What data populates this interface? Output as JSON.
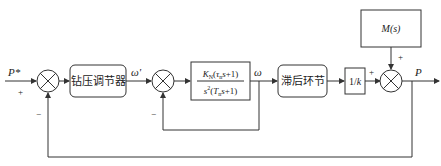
{
  "diagram": {
    "title": "",
    "signals": {
      "input": "P*",
      "omega_ref": "ω'",
      "omega": "ω",
      "output": "P"
    },
    "blocks": {
      "controller": "钻压调节器",
      "plant_num": "K_N(τ_n s+1)",
      "plant_den": "s²(T_n s+1)",
      "delay": "滞后环节",
      "gain": "1/k",
      "disturbance": "M(s)"
    },
    "signs": {
      "sum1_input": "+",
      "sum1_feedback": "−",
      "sum2_feedback": "−",
      "sum3_main": "+",
      "sum3_disturbance": "+"
    }
  }
}
